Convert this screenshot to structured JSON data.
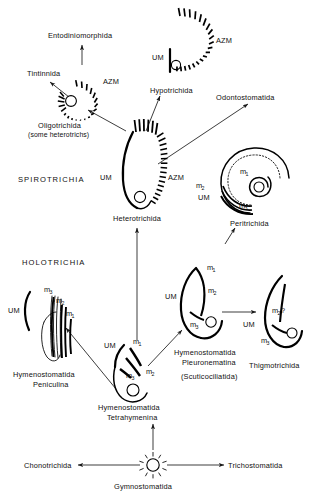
{
  "figure": {
    "background": "#ffffff",
    "ink": "#000000"
  },
  "groups": [
    {
      "id": "spirotrichia",
      "label": "SPIROTRICHIA",
      "x": 18,
      "y": 182
    },
    {
      "id": "holotrichia",
      "label": "HOLOTRICHIA",
      "x": 22,
      "y": 265
    }
  ],
  "taxa": [
    {
      "id": "entodiniomorphida",
      "label": "Entodiniomorphida",
      "x": 48,
      "y": 38
    },
    {
      "id": "tintinnida",
      "label": "Tintinnida",
      "x": 27,
      "y": 76
    },
    {
      "id": "oligotrichida",
      "label": "Oligotrichida",
      "label2": "(some heterotrichs)",
      "x": 38,
      "y": 118
    },
    {
      "id": "hypotrichida",
      "label": "Hypotrichida",
      "x": 150,
      "y": 89
    },
    {
      "id": "odontostomatida",
      "label": "Odontostomatida",
      "x": 216,
      "y": 98
    },
    {
      "id": "heterotrichida",
      "label": "Heterotrichida",
      "x": 117,
      "y": 215
    },
    {
      "id": "peritrichida",
      "label": "Peritrichida",
      "x": 228,
      "y": 220
    },
    {
      "id": "peniculina",
      "label": "Hymenostomatida",
      "label2": "Peniculina",
      "x": 18,
      "y": 378
    },
    {
      "id": "tetrahymenina",
      "label": "Hymenostomatida",
      "label2": "Tetrahymenina",
      "x": 98,
      "y": 408
    },
    {
      "id": "pleuronematina",
      "label": "Hymenostomatida",
      "label2": "Pleuronematina",
      "label3": "(Scuticociliatida)",
      "x": 174,
      "y": 353
    },
    {
      "id": "thigmotrichida",
      "label": "Thigmotrichida",
      "x": 252,
      "y": 365
    },
    {
      "id": "chonotrichida",
      "label": "Chonotrichida",
      "x": 28,
      "y": 455
    },
    {
      "id": "trichostomatida",
      "label": "Trichostomatida",
      "x": 228,
      "y": 455
    },
    {
      "id": "gymnostomatida",
      "label": "Gymnostomatida",
      "x": 112,
      "y": 482
    }
  ],
  "structure_labels": [
    {
      "id": "azm-hypotrichida",
      "text": "AZM",
      "x": 224,
      "y": 40
    },
    {
      "id": "um-hypotrichida",
      "text": "UM",
      "x": 154,
      "y": 57
    },
    {
      "id": "azm-oligotrichida",
      "text": "AZM",
      "x": 104,
      "y": 81
    },
    {
      "id": "um-heterotrichida",
      "text": "UM",
      "x": 102,
      "y": 177
    },
    {
      "id": "azm-heterotrichida",
      "text": "AZM",
      "x": 157,
      "y": 177
    },
    {
      "id": "um-peritrichida",
      "text": "UM",
      "x": 200,
      "y": 198
    },
    {
      "id": "m1-peritrichida",
      "text": "m",
      "sub": "1",
      "x": 243,
      "y": 172
    },
    {
      "id": "m2-peritrichida",
      "text": "m",
      "sub": "2",
      "x": 200,
      "y": 186
    },
    {
      "id": "m3-peritrichida",
      "text": "m",
      "sub": "3",
      "x": 242,
      "y": 205
    },
    {
      "id": "um-peniculina",
      "text": "UM",
      "x": 10,
      "y": 310
    },
    {
      "id": "m3-peniculina",
      "text": "m",
      "sub": "3",
      "x": 47,
      "y": 291
    },
    {
      "id": "m2-peniculina",
      "text": "m",
      "sub": "2",
      "x": 58,
      "y": 303
    },
    {
      "id": "m1-peniculina",
      "text": "m",
      "sub": "1",
      "x": 68,
      "y": 316
    },
    {
      "id": "um-tetrahymenina",
      "text": "UM",
      "x": 108,
      "y": 346
    },
    {
      "id": "m1-tetrahymenina",
      "text": "m",
      "sub": "1",
      "x": 136,
      "y": 342
    },
    {
      "id": "m2-tetrahymenina",
      "text": "m",
      "sub": "2",
      "x": 150,
      "y": 371
    },
    {
      "id": "m3-tetrahymenina",
      "text": "m",
      "sub": "3",
      "x": 130,
      "y": 375
    },
    {
      "id": "um-pleuronematina",
      "text": "UM",
      "x": 168,
      "y": 297
    },
    {
      "id": "m1-pleuronematina",
      "text": "m",
      "sub": "1",
      "x": 210,
      "y": 268
    },
    {
      "id": "m2-pleuronematina",
      "text": "m",
      "sub": "2",
      "x": 204,
      "y": 294
    },
    {
      "id": "m3-pleuronematina",
      "text": "m",
      "sub": "3",
      "x": 192,
      "y": 325
    },
    {
      "id": "um-thigmotrichida",
      "text": "UM",
      "x": 245,
      "y": 324
    },
    {
      "id": "m2-thigmotrichida",
      "text": "m",
      "sub": "2",
      "suffix": "?",
      "x": 275,
      "y": 311
    },
    {
      "id": "m3-thigmotrichida",
      "text": "m",
      "sub": "3",
      "x": 264,
      "y": 341
    }
  ],
  "connections": [
    {
      "id": "gymnostomatida-to-chonotrichida",
      "from": "gymnostomatida",
      "to": "chonotrichida"
    },
    {
      "id": "gymnostomatida-to-trichostomatida",
      "from": "gymnostomatida",
      "to": "trichostomatida"
    },
    {
      "id": "gymnostomatida-to-tetrahymenina",
      "from": "gymnostomatida",
      "to": "tetrahymenina"
    },
    {
      "id": "tetrahymenina-to-peniculina",
      "from": "tetrahymenina",
      "to": "peniculina"
    },
    {
      "id": "tetrahymenina-to-pleuronematina",
      "from": "tetrahymenina",
      "to": "pleuronematina"
    },
    {
      "id": "tetrahymenina-to-heterotrichida",
      "from": "tetrahymenina",
      "to": "heterotrichida"
    },
    {
      "id": "pleuronematina-to-thigmotrichida",
      "from": "pleuronematina",
      "to": "thigmotrichida"
    },
    {
      "id": "heterotrichida-to-oligotrichida",
      "from": "heterotrichida",
      "to": "oligotrichida"
    },
    {
      "id": "heterotrichida-to-hypotrichida",
      "from": "heterotrichida",
      "to": "hypotrichida"
    },
    {
      "id": "heterotrichida-to-odontostomatida",
      "from": "heterotrichida",
      "to": "odontostomatida"
    },
    {
      "id": "heterotrichida-to-peritrichida",
      "from": "heterotrichida",
      "to": "peritrichida"
    },
    {
      "id": "oligotrichida-to-tintinnida",
      "from": "oligotrichida",
      "to": "tintinnida"
    },
    {
      "id": "oligotrichida-to-entodiniomorphida",
      "from": "oligotrichida",
      "to": "entodiniomorphida"
    }
  ]
}
